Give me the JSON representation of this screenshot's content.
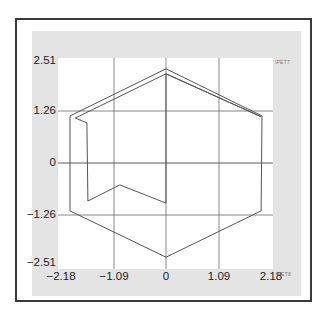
{
  "chart_data": {
    "type": "line",
    "title": "",
    "xlabel": "\\PET8",
    "ylabel": "\\PET7",
    "xlim": [
      -2.18,
      2.18
    ],
    "ylim": [
      -2.51,
      2.51
    ],
    "x_ticks": [
      "-2.18",
      "-1.09",
      "0",
      "1.09",
      "2.18"
    ],
    "y_ticks": [
      "2.51",
      "1.26",
      "0",
      "-1.26",
      "-2.51"
    ],
    "grid": true,
    "legend": null,
    "series": [
      {
        "name": "outer hexagon",
        "points": [
          [
            0,
            2.28
          ],
          [
            1.98,
            1.14
          ],
          [
            1.96,
            -1.16
          ],
          [
            0,
            -2.28
          ],
          [
            -1.98,
            -1.16
          ],
          [
            -1.98,
            1.14
          ],
          [
            0,
            2.28
          ]
        ]
      },
      {
        "name": "inner path",
        "points": [
          [
            0,
            -0.97
          ],
          [
            0,
            2.16
          ],
          [
            1.96,
            1.12
          ],
          [
            0,
            2.16
          ],
          [
            -1.87,
            1.09
          ],
          [
            -1.63,
            0.97
          ],
          [
            -1.61,
            -0.92
          ],
          [
            -0.95,
            -0.53
          ],
          [
            0,
            -0.97
          ]
        ]
      }
    ]
  },
  "labels": {
    "y_ticks": [
      "2.51",
      "1.26",
      "0",
      "−1.26",
      "−2.51"
    ],
    "x_ticks": [
      "−2.18",
      "−1.09",
      "0",
      "1.09",
      "2.18"
    ],
    "y_axis_tag": "\\PET7",
    "x_axis_tag": "\\PET8"
  },
  "colors": {
    "line": "#555555",
    "grid": "#6a6a6a",
    "panel": "#e4e4e4",
    "frame": "#3a3a3a"
  }
}
